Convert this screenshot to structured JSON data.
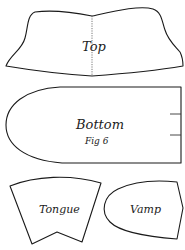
{
  "figure": {
    "caption": "Fig 6",
    "pieces": {
      "top": {
        "label": "Top"
      },
      "bottom": {
        "label": "Bottom"
      },
      "tongue": {
        "label": "Tongue"
      },
      "vamp": {
        "label": "Vamp"
      }
    }
  },
  "colors": {
    "line": "#1a1a1a",
    "background": "#ffffff"
  }
}
